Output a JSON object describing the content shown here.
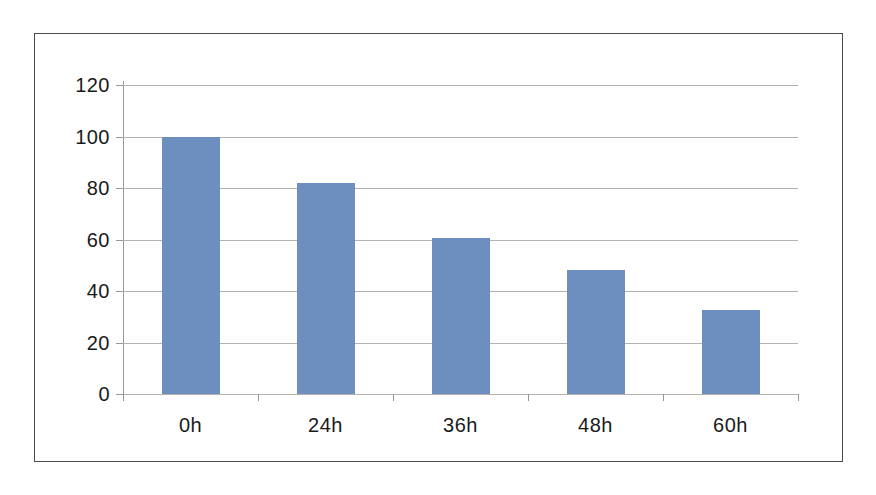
{
  "chart_data": {
    "type": "bar",
    "title": "",
    "subtitle": "",
    "xlabel": "",
    "ylabel": "",
    "categories": [
      "0h",
      "24h",
      "36h",
      "48h",
      "60h"
    ],
    "values": [
      100,
      82,
      60.5,
      48,
      32.5
    ],
    "series": [
      {
        "name": "",
        "values": [
          100,
          82,
          60.5,
          48,
          32.5
        ]
      }
    ],
    "ylim": [
      0,
      120
    ],
    "yticks": [
      0,
      20,
      40,
      60,
      80,
      100,
      120
    ],
    "ytick_labels": [
      "0",
      "20",
      "40",
      "60",
      "80",
      "100",
      "120"
    ],
    "grid": true,
    "grid_axis": "y",
    "legend": false,
    "legend_position": "none",
    "annotations": [],
    "colors": {
      "bar_fill": "#6c8fc0",
      "gridline": "#b5b2ae",
      "axis": "#9a9894",
      "frame_border": "#4a4a4a",
      "background": "#ffffff",
      "tick_label": "#1a1a1a"
    }
  }
}
